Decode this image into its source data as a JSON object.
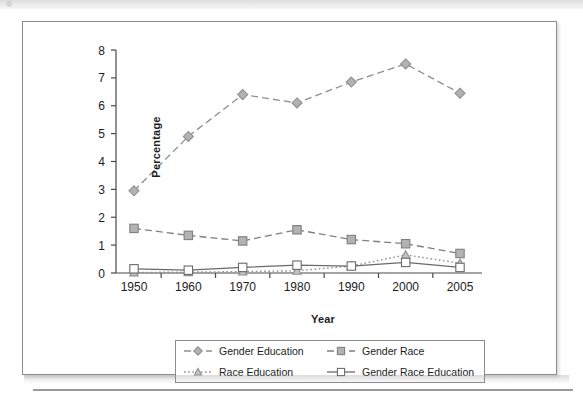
{
  "figure": {
    "background_color": "#ffffff",
    "frame_color": "#8d8d8d"
  },
  "axis_titles": {
    "y": "Percentage",
    "x": "Year"
  },
  "legend": {
    "entries": [
      {
        "label": "Gender Education",
        "marker": "diamond-marker",
        "line": "dashed"
      },
      {
        "label": "Gender Race",
        "marker": "filled-square-marker",
        "line": "dashed"
      },
      {
        "label": "Race Education",
        "marker": "triangle-marker",
        "line": "dotted"
      },
      {
        "label": "Gender Race Education",
        "marker": "open-square-marker",
        "line": "solid"
      }
    ]
  },
  "chart_data": {
    "type": "line",
    "title": "",
    "xlabel": "Year",
    "ylabel": "Percentage",
    "x": [
      1950,
      1960,
      1970,
      1980,
      1990,
      2000,
      2005
    ],
    "xtick_labels": [
      "1950",
      "1960",
      "1970",
      "1980",
      "1990",
      "2000",
      "2005"
    ],
    "ytick_labels": [
      "0",
      "1",
      "2",
      "3",
      "4",
      "5",
      "6",
      "7",
      "8"
    ],
    "ylim": [
      0,
      8
    ],
    "ytick_step": 1,
    "grid": false,
    "legend_position": "bottom",
    "series": [
      {
        "name": "Gender Education",
        "values": [
          2.95,
          4.9,
          6.4,
          6.1,
          6.85,
          7.5,
          6.45
        ],
        "color": "#8f8f8f",
        "marker": "diamond",
        "marker_fill": "#b2b2b2",
        "line_style": "dashed"
      },
      {
        "name": "Gender Race",
        "values": [
          1.6,
          1.35,
          1.15,
          1.55,
          1.2,
          1.05,
          0.7
        ],
        "color": "#808080",
        "marker": "square",
        "marker_fill": "#b2b2b2",
        "line_style": "dashed"
      },
      {
        "name": "Race Education",
        "values": [
          0.02,
          0.03,
          0.05,
          0.08,
          0.25,
          0.65,
          0.35
        ],
        "color": "#8f8f8f",
        "marker": "triangle",
        "marker_fill": "#c4c4c4",
        "line_style": "dotted"
      },
      {
        "name": "Gender Race Education",
        "values": [
          0.15,
          0.1,
          0.2,
          0.28,
          0.25,
          0.38,
          0.2
        ],
        "color": "#6b6b6b",
        "marker": "square",
        "marker_fill": "#ffffff",
        "line_style": "solid"
      }
    ]
  }
}
